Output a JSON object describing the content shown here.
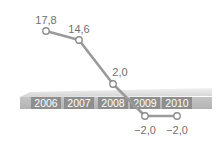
{
  "chart_data": {
    "type": "line",
    "title": "",
    "xlabel": "",
    "ylabel": "",
    "categories": [
      "2006",
      "2007",
      "2008",
      "2009",
      "2010"
    ],
    "series": [
      {
        "name": "value",
        "values": [
          17.8,
          14.6,
          2.0,
          -2.0,
          -2.0
        ]
      }
    ],
    "value_labels": [
      "17,8",
      "14,6",
      "2,0",
      "−2,0",
      "−2,0"
    ],
    "ylim": [
      -2.0,
      17.8
    ],
    "grid": false,
    "legend": "none",
    "colors": {
      "line": "#9a9a9a",
      "marker_fill": "#ffffff",
      "marker_stroke": "#8c8c8c",
      "band_top": "#e4e4e4",
      "band_bottom": "#c9c9c9",
      "tab_fill": "#8e8e8e",
      "label_text": "#6f6f6f"
    }
  }
}
